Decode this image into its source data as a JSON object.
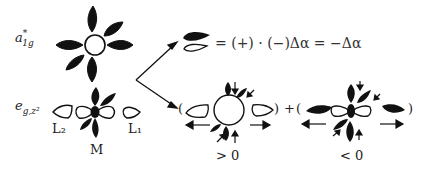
{
  "diagram": {
    "rows": [
      {
        "label_main": "a",
        "label_sup": "*",
        "label_sub": "1g",
        "description": "a1g* orbital: filled lobes around central ring"
      },
      {
        "label_main": "e",
        "label_sub": "g,z²",
        "description": "eg,z2 orbital: metal dz2 with ligand lobes"
      }
    ],
    "ligand_labels": {
      "left": "L₂",
      "right": "L₁",
      "metal": "M"
    },
    "equation": {
      "text": "= (+) · (−)Δα = −Δα"
    },
    "combination": {
      "open_paren_1": "(",
      "close_paren_1": ")",
      "plus": "+",
      "open_paren_2": "(",
      "close_paren_2": ")",
      "sign_1": "> 0",
      "sign_2": "< 0"
    },
    "colors": {
      "ink": "#111111",
      "background": "#ffffff"
    }
  }
}
